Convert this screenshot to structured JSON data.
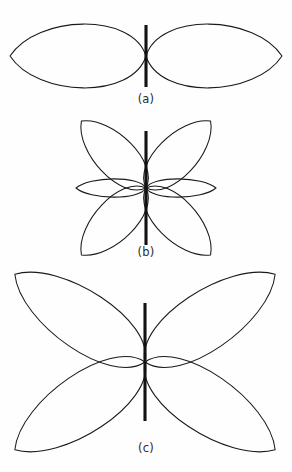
{
  "figure": {
    "title": "",
    "background_color": "#fefefe",
    "stroke_color": "#1a1a1a",
    "dipole_color": "#121212",
    "panels": [
      {
        "id": "a",
        "caption": "(a)",
        "center_x": 146,
        "center_y": 56,
        "dipole_half_length": 31,
        "lobe_count": 2
      },
      {
        "id": "b",
        "caption": "(b)",
        "center_x": 146,
        "center_y": 188,
        "dipole_half_length": 57,
        "lobe_count": 6
      },
      {
        "id": "c",
        "caption": "(c)",
        "center_x": 145,
        "center_y": 362,
        "dipole_half_length": 59,
        "lobe_count": 4
      }
    ]
  },
  "chart_data": {
    "type": "line",
    "subtitle": "",
    "xlabel": "",
    "ylabel": "",
    "grid": false,
    "legend": null,
    "axis_ranges": {
      "angle_deg": [
        0,
        360
      ],
      "radius_normalized": [
        0,
        1
      ]
    },
    "annotations": [
      "(a)",
      "(b)",
      "(c)"
    ],
    "series": [
      {
        "name": "(a)",
        "panel": "a",
        "description": "Half-wave dipole pattern: two large lobes broadside (horizontal), nulls along the dipole axis (vertical)",
        "center": [
          146,
          56
        ],
        "lobes": [
          {
            "angle_deg": 0,
            "length_px": 136,
            "half_width_px": 35
          },
          {
            "angle_deg": 180,
            "length_px": 136,
            "half_width_px": 35
          }
        ],
        "theta_deg": [
          0,
          15,
          30,
          45,
          60,
          75,
          90,
          105,
          120,
          135,
          150,
          165,
          180,
          195,
          210,
          225,
          240,
          255,
          270,
          285,
          300,
          315,
          330,
          345,
          360
        ],
        "r_normalized": [
          1.0,
          0.97,
          0.89,
          0.76,
          0.58,
          0.33,
          0.0,
          0.33,
          0.58,
          0.76,
          0.89,
          0.97,
          1.0,
          0.97,
          0.89,
          0.76,
          0.58,
          0.33,
          0.0,
          0.33,
          0.58,
          0.76,
          0.89,
          0.97,
          1.0
        ]
      },
      {
        "name": "(b)",
        "panel": "b",
        "description": "Multi-lobe dipole pattern: four large diagonal lobes at about 46 degrees plus two small horizontal side lobes",
        "center": [
          146,
          188
        ],
        "lobes": [
          {
            "angle_deg": 46,
            "length_px": 93,
            "half_width_px": 22
          },
          {
            "angle_deg": 134,
            "length_px": 93,
            "half_width_px": 22
          },
          {
            "angle_deg": 226,
            "length_px": 93,
            "half_width_px": 22
          },
          {
            "angle_deg": 314,
            "length_px": 93,
            "half_width_px": 22
          },
          {
            "angle_deg": 0,
            "length_px": 70,
            "half_width_px": 10
          },
          {
            "angle_deg": 180,
            "length_px": 70,
            "half_width_px": 10
          }
        ],
        "major_lobe_angles_deg": [
          46,
          134,
          226,
          314
        ],
        "minor_lobe_angles_deg": [
          0,
          180
        ],
        "major_lobe_relative_amplitude": 1.0,
        "minor_lobe_relative_amplitude": 0.75
      },
      {
        "name": "(c)",
        "panel": "c",
        "description": "Four-lobe dipole pattern: four large lobes at about 34 degrees from horizontal, nulls vertical and horizontal",
        "center": [
          145,
          362
        ],
        "lobes": [
          {
            "angle_deg": 34,
            "length_px": 157,
            "half_width_px": 32
          },
          {
            "angle_deg": 146,
            "length_px": 157,
            "half_width_px": 32
          },
          {
            "angle_deg": 214,
            "length_px": 157,
            "half_width_px": 32
          },
          {
            "angle_deg": 326,
            "length_px": 157,
            "half_width_px": 32
          }
        ],
        "major_lobe_angles_deg": [
          34,
          146,
          214,
          326
        ],
        "major_lobe_relative_amplitude": 1.0
      }
    ]
  }
}
